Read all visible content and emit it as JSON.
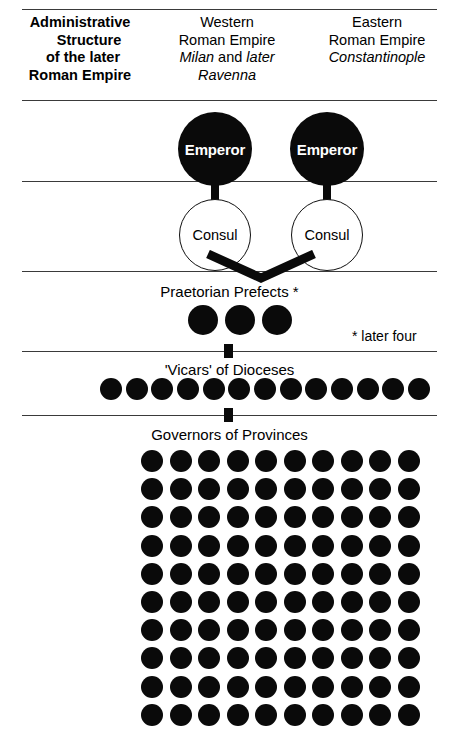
{
  "diagram": {
    "header": {
      "title_lines": [
        "Administrative",
        "Structure",
        "of the later",
        "Roman Empire"
      ],
      "west": {
        "line1": "Western",
        "line2": "Roman Empire",
        "capital_a": "Milan",
        "capital_join": " and ",
        "capital_b": "later",
        "capital_c": "Ravenna"
      },
      "east": {
        "line1": "Eastern",
        "line2": "Roman Empire",
        "capital": "Constantinople"
      }
    },
    "tiers": {
      "emperor_label": "Emperor",
      "consul_label": "Consul",
      "prefects_label": "Praetorian Prefects *",
      "prefects_note": "* later four",
      "vicars_label": "'Vicars' of Dioceses",
      "governors_label": "Governors of Provinces"
    },
    "counts": {
      "emperors": 2,
      "consuls": 2,
      "prefects": 3,
      "vicars": 13,
      "governor_rows": 10,
      "governor_cols": 10,
      "governors_total": 100
    },
    "colors": {
      "ink": "#0a0a0a",
      "paper": "#ffffff",
      "rule": "#3a3a3a",
      "circle_fill_filled": "#0a0a0a",
      "circle_fill_open": "#ffffff"
    }
  }
}
